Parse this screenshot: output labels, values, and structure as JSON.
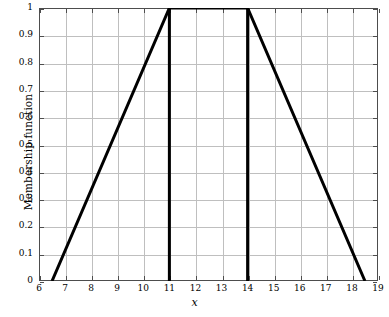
{
  "chart_data": {
    "type": "line",
    "title": "",
    "xlabel": "x",
    "ylabel": "Membership function",
    "xlim": [
      6,
      19
    ],
    "ylim": [
      0,
      1
    ],
    "grid": true,
    "legend": null,
    "legend_position": "none",
    "x_ticks": [
      6,
      7,
      8,
      9,
      10,
      11,
      12,
      13,
      14,
      15,
      16,
      17,
      18,
      19
    ],
    "x_tick_labels": [
      "6",
      "7",
      "8",
      "9",
      "10",
      "11",
      "12",
      "13",
      "14",
      "15",
      "16",
      "17",
      "18",
      "19"
    ],
    "y_ticks": [
      0,
      0.1,
      0.2,
      0.3,
      0.4,
      0.5,
      0.6,
      0.7,
      0.8,
      0.9,
      1
    ],
    "y_tick_labels": [
      "0",
      "0.1",
      "0.2",
      "0.3",
      "0.4",
      "0.5",
      "0.6",
      "0.7",
      "0.8",
      "0.9",
      "1"
    ],
    "line_color": "#000000",
    "line_width": 3,
    "grid_color": "#bfbfbf",
    "axis_color": "#4d4d4d",
    "series": [
      {
        "name": "trapezoidal membership function",
        "x": [
          6.5,
          11,
          14,
          18.5
        ],
        "values": [
          0,
          1,
          1,
          0
        ]
      }
    ],
    "annotations": [
      {
        "name": "support-boundary-left",
        "type": "vline",
        "x": 11,
        "y0": 0,
        "y1": 1
      },
      {
        "name": "support-boundary-right",
        "type": "vline",
        "x": 14,
        "y0": 0,
        "y1": 1
      }
    ]
  }
}
